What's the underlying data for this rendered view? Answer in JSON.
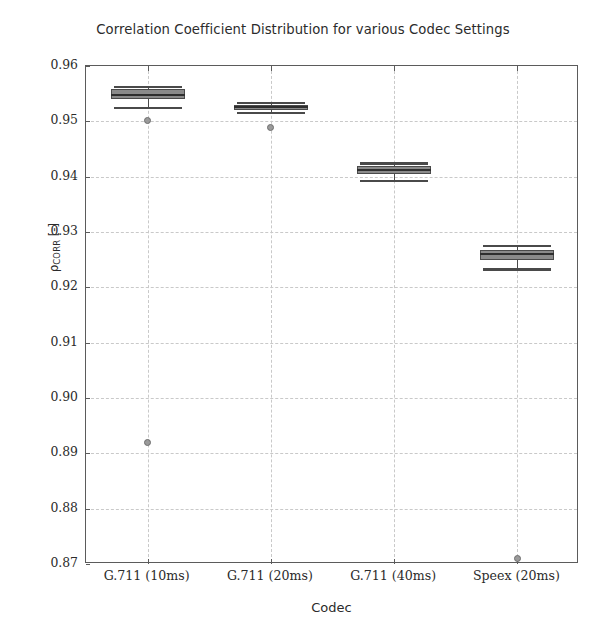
{
  "chart_data": {
    "type": "box",
    "title": "Correlation Coefficient Distribution for various Codec Settings",
    "xlabel": "Codec",
    "ylabel": "ρCORR [-]",
    "ylabel_base": "ρ",
    "ylabel_sub": "CORR",
    "ylabel_unit": " [-]",
    "categories": [
      "G.711 (10ms)",
      "G.711 (20ms)",
      "G.711 (40ms)",
      "Speex (20ms)"
    ],
    "ylim": [
      0.87,
      0.96
    ],
    "yticks": [
      0.96,
      0.95,
      0.94,
      0.93,
      0.92,
      0.91,
      0.9,
      0.89,
      0.88,
      0.87
    ],
    "ytick_labels": [
      "0.96",
      "0.95",
      "0.94",
      "0.93",
      "0.92",
      "0.91",
      "0.90",
      "0.89",
      "0.88",
      "0.87"
    ],
    "grid": true,
    "grid_style": "dashed",
    "grid_color": "#c9c9c9",
    "legend": "none",
    "box_fill_color": "#8a8a8a",
    "box_edge_color": "#4a4a4a",
    "median_color": "#2e2e2e",
    "flier_color": "#9a9a9a",
    "boxes": [
      {
        "category": "G.711 (10ms)",
        "whisker_low": 0.9524,
        "q1": 0.954,
        "median": 0.9548,
        "q3": 0.9558,
        "whisker_high": 0.9562,
        "fliers": [
          0.9501,
          0.892
        ]
      },
      {
        "category": "G.711 (20ms)",
        "whisker_low": 0.9515,
        "q1": 0.9521,
        "median": 0.9526,
        "q3": 0.953,
        "whisker_high": 0.9533,
        "fliers": [
          0.9488
        ]
      },
      {
        "category": "G.711 (40ms)",
        "whisker_low": 0.9392,
        "q1": 0.9405,
        "median": 0.9412,
        "q3": 0.9419,
        "whisker_high": 0.9424,
        "fliers": []
      },
      {
        "category": "Speex (20ms)",
        "whisker_low": 0.9232,
        "q1": 0.9249,
        "median": 0.926,
        "q3": 0.9268,
        "whisker_high": 0.9275,
        "fliers": [
          0.871
        ]
      }
    ]
  }
}
